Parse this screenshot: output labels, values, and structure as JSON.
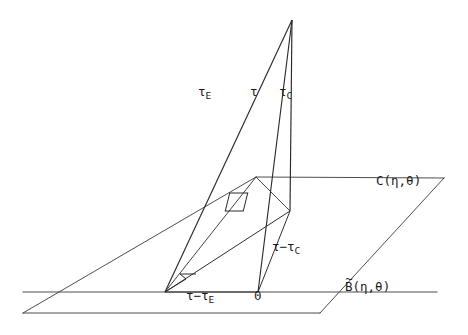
{
  "figure": {
    "background_color": "#ffffff",
    "line_color": "#2a2a2a",
    "plane_edge_color": "#3a3a3a",
    "width": 468,
    "height": 335
  },
  "labels": {
    "tau_E": {
      "base": "τ",
      "subscript": "E",
      "x": 198,
      "y": 93
    },
    "tau": {
      "base": "τ",
      "subscript": "",
      "x": 250,
      "y": 93
    },
    "tau_C": {
      "base": "τ",
      "subscript": "C",
      "x": 279,
      "y": 93
    },
    "tau_minus_tau_C": {
      "base": "τ−τ",
      "subscript": "C",
      "x": 272,
      "y": 248
    },
    "tau_minus_tau_E": {
      "base": "τ−τ",
      "subscript": "E",
      "x": 186,
      "y": 297
    },
    "origin": {
      "base": "0",
      "subscript": "",
      "x": 254,
      "y": 296
    },
    "C_eta_theta": {
      "base": "C(η,θ)",
      "subscript": "",
      "x": 376,
      "y": 182
    },
    "B_tilde_eta_theta": {
      "base": "B(η,θ)",
      "accent": "~",
      "subscript": "",
      "x": 345,
      "y": 288
    }
  },
  "geometry": {
    "apex": {
      "x": 292,
      "y": 20
    },
    "origin_point": {
      "x": 258,
      "y": 292
    },
    "left_foot": {
      "x": 165,
      "y": 292
    },
    "tau_c_foot": {
      "x": 290,
      "y": 211
    },
    "upper_plane": [
      {
        "x": 256,
        "y": 177
      },
      {
        "x": 444,
        "y": 178
      },
      {
        "x": 340,
        "y": 313
      },
      {
        "x": 23,
        "y": 313
      }
    ],
    "lower_horizontal": {
      "x1": 23,
      "y1": 292,
      "x2": 437,
      "y2": 292
    }
  }
}
